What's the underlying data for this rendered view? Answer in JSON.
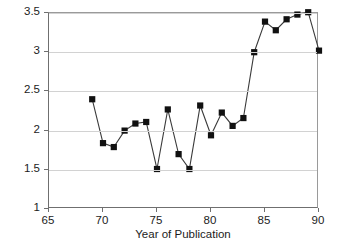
{
  "chart_data": {
    "type": "line",
    "title": "",
    "subtitle": "",
    "xlabel": "Year of Publication",
    "ylabel": "% of Total JEL Publications",
    "xlim": [
      65,
      90
    ],
    "ylim": [
      1,
      3.5
    ],
    "xticks": [
      65,
      70,
      75,
      80,
      85,
      90
    ],
    "yticks": [
      1,
      1.5,
      2,
      2.5,
      3,
      3.5
    ],
    "xtick_labels": [
      "65",
      "70",
      "75",
      "80",
      "85",
      "90"
    ],
    "ytick_labels": [
      "1",
      "1.5",
      "2",
      "2.5",
      "3",
      "3.5"
    ],
    "grid": "horizontal",
    "legend": "none",
    "marker": "filled-square",
    "series": [
      {
        "name": "% of Total JEL Publications",
        "color": "#111111",
        "x": [
          69,
          70,
          71,
          72,
          73,
          74,
          75,
          76,
          77,
          78,
          79,
          80,
          81,
          82,
          83,
          84,
          85,
          86,
          87,
          88,
          89,
          90
        ],
        "values": [
          2.4,
          1.84,
          1.79,
          2.0,
          2.09,
          2.11,
          1.51,
          2.27,
          1.7,
          1.51,
          2.32,
          1.94,
          2.23,
          2.06,
          2.16,
          3.0,
          3.39,
          3.28,
          3.42,
          3.48,
          3.51,
          3.02
        ]
      }
    ]
  },
  "axis": {
    "y_title": "% of Total JEL Publications",
    "x_title": "Year of Publication"
  }
}
